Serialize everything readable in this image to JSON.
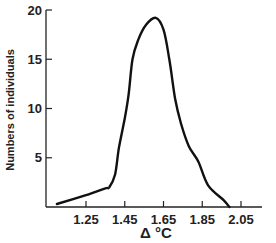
{
  "chart_data": {
    "type": "line",
    "title": "",
    "xlabel": "Δ °C",
    "ylabel": "Numbers of individuals",
    "xlim": [
      1.1,
      2.15
    ],
    "ylim": [
      0,
      20
    ],
    "x_ticks": [
      1.25,
      1.45,
      1.65,
      1.85,
      2.05
    ],
    "x_tick_labels": [
      "1.25",
      "1.45",
      "1.65",
      "1.85",
      "2.05"
    ],
    "y_ticks": [
      5,
      10,
      15,
      20
    ],
    "y_tick_labels": [
      "5",
      "10",
      "15",
      "20"
    ],
    "grid": false,
    "legend": null,
    "series": [
      {
        "name": "distribution",
        "x": [
          1.1,
          1.25,
          1.35,
          1.37,
          1.4,
          1.42,
          1.45,
          1.47,
          1.49,
          1.52,
          1.56,
          1.61,
          1.65,
          1.68,
          1.71,
          1.74,
          1.78,
          1.83,
          1.88,
          1.96,
          1.99
        ],
        "y": [
          0.3,
          1.2,
          1.9,
          2.0,
          3.3,
          6.0,
          9.0,
          11.4,
          15.0,
          17.0,
          18.5,
          19.2,
          18.0,
          15.0,
          11.0,
          8.5,
          6.2,
          4.6,
          2.2,
          0.7,
          0.0
        ]
      }
    ]
  }
}
